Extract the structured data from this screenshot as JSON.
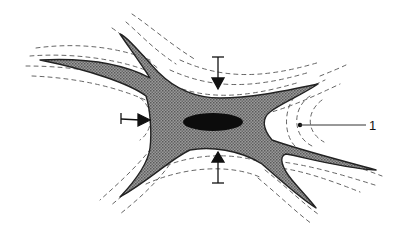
{
  "figure": {
    "type": "schematic",
    "labels": [
      {
        "id": "label-1",
        "text": "1",
        "leader_from": [
          300,
          125
        ],
        "leader_to": [
          366,
          125
        ]
      }
    ],
    "arrows": [
      {
        "id": "arrow-top",
        "direction": "down",
        "from": [
          218,
          57
        ],
        "to": [
          218,
          88
        ]
      },
      {
        "id": "arrow-bottom",
        "direction": "up",
        "from": [
          218,
          184
        ],
        "to": [
          218,
          153
        ]
      },
      {
        "id": "arrow-left",
        "direction": "right",
        "from": [
          121,
          118
        ],
        "to": [
          150,
          121
        ]
      }
    ],
    "colors": {
      "cell_fill": "#8a8a8a",
      "cell_outline": "#222222",
      "nucleus": "#0c0c0c",
      "dash": "#555555",
      "ink": "#111111",
      "background": "#ffffff"
    }
  }
}
